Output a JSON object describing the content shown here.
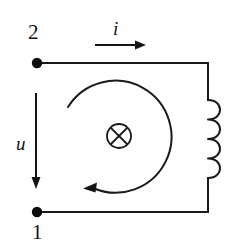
{
  "figure": {
    "kind": "circuit-diagram",
    "width": 231,
    "height": 247,
    "background_color": "#ffffff",
    "line_color": "#1a1a1a"
  },
  "terminals": [
    {
      "id": "node-2",
      "label": "2",
      "position": "top-left",
      "x": 37,
      "y": 63
    },
    {
      "id": "node-1",
      "label": "1",
      "position": "bottom-left",
      "x": 37,
      "y": 212
    }
  ],
  "labels": {
    "current": "i",
    "voltage": "u",
    "node_top": "2",
    "node_bottom": "1"
  },
  "arrows": {
    "current": {
      "symbol": "i",
      "direction": "right",
      "orientation": "horizontal",
      "from_x": 95,
      "to_x": 146,
      "y": 45
    },
    "voltage": {
      "symbol": "u",
      "direction": "down",
      "orientation": "vertical",
      "x": 36,
      "from_y": 93,
      "to_y": 188
    },
    "flux_loop": {
      "direction": "counterclockwise",
      "center_x": 122,
      "center_y": 144,
      "radius": 56,
      "arrowhead_x": 85,
      "arrowhead_y": 187
    }
  },
  "symbols": {
    "flux_into_page": {
      "name": "circle-cross-icon",
      "meaning": "flux into page",
      "center_x": 119,
      "center_y": 136,
      "radius": 12
    },
    "inductor": {
      "name": "inductor-coil",
      "loops": 4,
      "side": "right",
      "x": 208,
      "top_y": 100,
      "bottom_y": 178
    }
  },
  "wires": {
    "top": {
      "from_x": 37,
      "from_y": 63,
      "to_x": 208,
      "to_y": 63
    },
    "right_upper": {
      "from_x": 208,
      "from_y": 63,
      "to_x": 208,
      "to_y": 100
    },
    "right_lower": {
      "from_x": 208,
      "from_y": 178,
      "to_x": 208,
      "to_y": 212
    },
    "bottom": {
      "from_x": 208,
      "from_y": 212,
      "to_x": 37,
      "to_y": 212
    }
  }
}
